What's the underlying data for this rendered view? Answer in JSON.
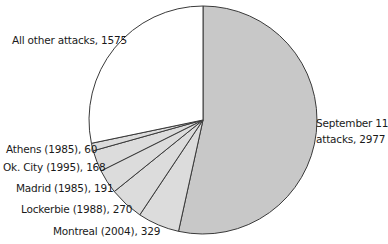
{
  "chart_data": {
    "type": "pie",
    "title": "",
    "start_angle": "12 o'clock, clockwise",
    "categories": [
      "September 11 attacks",
      "Montreal (2004)",
      "Lockerbie (1988)",
      "Madrid (1985)",
      "Ok. City (1995)",
      "Athens (1985)",
      "All other attacks"
    ],
    "values": [
      2977,
      329,
      270,
      191,
      168,
      60,
      1575
    ],
    "colors": [
      "#c8c8c8",
      "#dcdcdc",
      "#dcdcdc",
      "#dcdcdc",
      "#dcdcdc",
      "#dcdcdc",
      "#ffffff"
    ],
    "labels": [
      {
        "line1": "September 11",
        "line2": "attacks, 2977"
      },
      {
        "text": "Montreal (2004), 329"
      },
      {
        "text": "Lockerbie (1988), 270"
      },
      {
        "text": "Madrid (1985), 191"
      },
      {
        "text": "Ok. City (1995), 168"
      },
      {
        "text": "Athens (1985), 60"
      },
      {
        "text": "All other attacks, 1575"
      }
    ],
    "legend": "none (direct labels)",
    "grid": false
  }
}
